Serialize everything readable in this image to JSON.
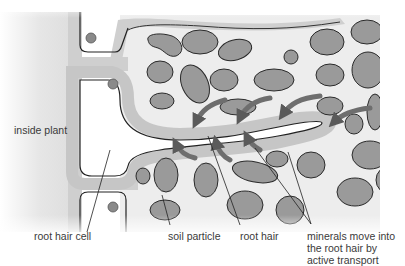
{
  "diagram": {
    "colors": {
      "soil_particle_fill": "#9a9a9a",
      "soil_particle_stroke": "#2a2a2a",
      "cell_wall": "#c8c8c8",
      "membrane": "#222222",
      "soil_background": "#ededed",
      "arrow": "#6e6e6e",
      "nucleus": "#8a8a8a"
    }
  },
  "labels": {
    "inside_plant": "inside plant",
    "root_hair_cell": "root hair cell",
    "soil_particle": "soil particle",
    "root_hair": "root hair",
    "minerals": [
      "minerals move into",
      "the root hair by",
      "active transport"
    ]
  }
}
